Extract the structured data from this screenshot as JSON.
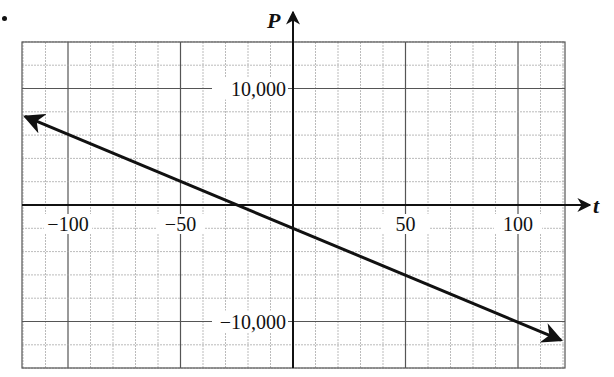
{
  "problem_marker": ".",
  "chart_data": {
    "type": "line",
    "title": "",
    "xlabel": "t",
    "ylabel": "P",
    "xlim": [
      -120,
      120
    ],
    "ylim": [
      -14000,
      14000
    ],
    "x_ticks": [
      -100,
      -50,
      50,
      100
    ],
    "x_tick_labels": [
      "−100",
      "−50",
      "50",
      "100"
    ],
    "y_ticks": [
      10000,
      -10000
    ],
    "y_tick_labels": [
      "10,000",
      "−10,000"
    ],
    "grid": {
      "on": true,
      "x_minor_step": 10,
      "x_major_step": 50,
      "y_minor_step": 2000,
      "y_major_step": 10000
    },
    "series": [
      {
        "name": "P",
        "equation": "P = -80t - 2000",
        "x": [
          -120,
          -25,
          0,
          120
        ],
        "values": [
          7600,
          0,
          -2000,
          -11600
        ],
        "arrows_both_ends": true
      }
    ],
    "intercepts": {
      "t_intercept": -25,
      "P_intercept": -2000
    }
  }
}
